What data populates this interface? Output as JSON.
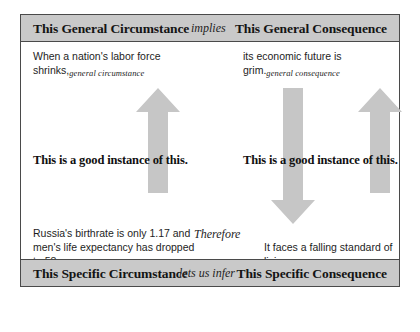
{
  "diagram": {
    "type": "argument-structure-grid",
    "header": {
      "left_label": "This General Circumstance",
      "connector_label": "implies",
      "right_label": "This General Consequence"
    },
    "footer": {
      "left_label": "This Specific Circumstance",
      "connector_label": "lets us infer",
      "right_label": "This Specific Consequence"
    },
    "quadrants": {
      "top_left": {
        "text": "When a nation's labor force shrinks,",
        "annotation": "general circumstance"
      },
      "top_right": {
        "text": "its economic future is grim.",
        "annotation": "general consequence"
      },
      "bottom_left": {
        "text": "Russia's birthrate is only 1.17 and men's life expectancy has dropped to 58.",
        "annotation": "specific reason"
      },
      "bottom_right": {
        "text": "It faces a falling standard of living",
        "annotation": "specific claim"
      }
    },
    "instance_claims": {
      "left": "This is a good instance of this.",
      "right": "This is a good instance of this."
    },
    "middle_connector": "Therefore",
    "arrows": [
      {
        "name": "left-instance-arrow",
        "direction": "up"
      },
      {
        "name": "middle-inference-arrow",
        "direction": "down"
      },
      {
        "name": "right-instance-arrow",
        "direction": "up"
      }
    ],
    "colors": {
      "band_fill": "#c9c9c9",
      "border": "#4a4a4a",
      "arrow_fill": "#c6c6c6",
      "text": "#1d1d1d"
    }
  }
}
